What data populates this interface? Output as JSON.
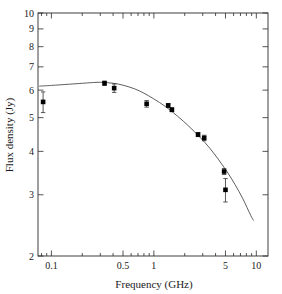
{
  "chart_data": {
    "type": "scatter",
    "title": "",
    "xlabel": "Frequency (GHz)",
    "ylabel": "Flux density (Jy)",
    "xscale": "log",
    "yscale": "log",
    "xlim": [
      0.074,
      13.0
    ],
    "ylim": [
      2,
      10
    ],
    "grid": false,
    "legend": null,
    "xtick_labels": [
      "0.1",
      "0.5",
      "1",
      "5",
      "10"
    ],
    "xtick_values": [
      0.1,
      0.5,
      1,
      5,
      10
    ],
    "ytick_labels": [
      "2",
      "3",
      "4",
      "5",
      "6",
      "7",
      "8",
      "9",
      "10"
    ],
    "ytick_values": [
      2,
      3,
      4,
      5,
      6,
      7,
      8,
      9,
      10
    ],
    "series": [
      {
        "name": "Measured flux density",
        "type": "scatter",
        "marker": "square",
        "color": "#000000",
        "points": [
          {
            "x": 0.083,
            "y": 5.55,
            "yerr": 0.38
          },
          {
            "x": 0.33,
            "y": 6.28,
            "yerr": 0.09
          },
          {
            "x": 0.41,
            "y": 6.08,
            "yerr": 0.17
          },
          {
            "x": 0.85,
            "y": 5.48,
            "yerr": 0.12
          },
          {
            "x": 1.38,
            "y": 5.42,
            "yerr": 0.07
          },
          {
            "x": 1.5,
            "y": 5.27,
            "yerr": 0.07
          },
          {
            "x": 2.7,
            "y": 4.47,
            "yerr": 0.06
          },
          {
            "x": 3.1,
            "y": 4.37,
            "yerr": 0.08
          },
          {
            "x": 4.85,
            "y": 3.5,
            "yerr": 0.07
          },
          {
            "x": 5.0,
            "y": 3.1,
            "yerr": 0.24
          }
        ]
      },
      {
        "name": "Model spectrum",
        "type": "line",
        "color": "#4d4d4d",
        "points": [
          {
            "x": 0.076,
            "y": 6.16
          },
          {
            "x": 0.1,
            "y": 6.19
          },
          {
            "x": 0.15,
            "y": 6.24
          },
          {
            "x": 0.22,
            "y": 6.29
          },
          {
            "x": 0.3,
            "y": 6.32
          },
          {
            "x": 0.4,
            "y": 6.28
          },
          {
            "x": 0.5,
            "y": 6.2
          },
          {
            "x": 0.65,
            "y": 6.05
          },
          {
            "x": 0.8,
            "y": 5.88
          },
          {
            "x": 1.0,
            "y": 5.66
          },
          {
            "x": 1.3,
            "y": 5.38
          },
          {
            "x": 1.7,
            "y": 5.05
          },
          {
            "x": 2.2,
            "y": 4.72
          },
          {
            "x": 2.8,
            "y": 4.4
          },
          {
            "x": 3.5,
            "y": 4.09
          },
          {
            "x": 4.3,
            "y": 3.78
          },
          {
            "x": 5.2,
            "y": 3.49
          },
          {
            "x": 6.2,
            "y": 3.21
          },
          {
            "x": 7.4,
            "y": 2.92
          },
          {
            "x": 8.8,
            "y": 2.62
          },
          {
            "x": 9.4,
            "y": 2.53
          }
        ]
      }
    ]
  },
  "axes": {
    "x_title": "Frequency (GHz)",
    "y_title": "Flux density (Jy)"
  }
}
